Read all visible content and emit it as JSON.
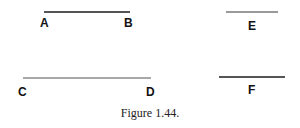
{
  "figure": {
    "caption": "Figure 1.44.",
    "segments": [
      {
        "id": "AB",
        "start_label": "A",
        "end_label": "B",
        "color": "#555555"
      },
      {
        "id": "E",
        "label": "E",
        "color": "#9a9a9a"
      },
      {
        "id": "CD",
        "start_label": "C",
        "end_label": "D",
        "color": "#a8a8a8"
      },
      {
        "id": "F",
        "label": "F",
        "color": "#555555"
      }
    ]
  }
}
